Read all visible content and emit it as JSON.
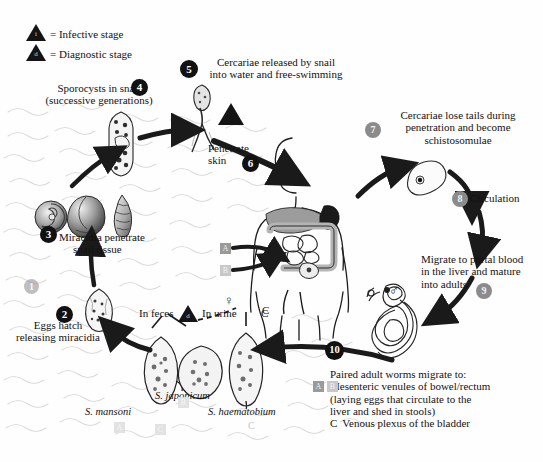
{
  "legend": {
    "infective": {
      "letter": "i",
      "label": "= Infective stage"
    },
    "diagnostic": {
      "letter": "d",
      "label": "= Diagnostic stage"
    }
  },
  "steps": [
    {
      "n": "1",
      "style": "gray-faint"
    },
    {
      "n": "2",
      "style": "black"
    },
    {
      "n": "3",
      "style": "black"
    },
    {
      "n": "4",
      "style": "black"
    },
    {
      "n": "5",
      "style": "black"
    },
    {
      "n": "6",
      "style": "black"
    },
    {
      "n": "7",
      "style": "gray"
    },
    {
      "n": "8",
      "style": "gray"
    },
    {
      "n": "9",
      "style": "gray"
    },
    {
      "n": "10",
      "style": "black"
    }
  ],
  "labels": {
    "sporocysts_line1": "Sporocysts in snail",
    "sporocysts_line2": "(successive generations)",
    "cercariae_released_line1": "Cercariae released by snail",
    "cercariae_released_line2": "into water and free-swimming",
    "penetrate_line1": "Penetrate",
    "penetrate_line2": "skin",
    "lose_tails_line1": "Cercariae lose tails during",
    "lose_tails_line2": "penetration and become",
    "lose_tails_line3": "schistosomulae",
    "circulation": "Circulation",
    "migrate_line1": "Migrate to portal blood",
    "migrate_line2": "in the liver and mature",
    "migrate_line3": "into adults",
    "miracidia_line1": "Miracidia penetrate",
    "miracidia_line2": "snail tissue",
    "eggs_hatch_line1": "Eggs hatch",
    "eggs_hatch_line2": "releasing miracidia",
    "in_feces": "In feces",
    "in_urine": "In urine",
    "species_mansoni": "S. mansoni",
    "species_japonicum": "S. japonicum",
    "species_haematobium": "S. haematobium"
  },
  "outcome": {
    "intro": "Paired adult worms migrate to:",
    "a_b_line1": "Mesenteric venules of bowel/rectum",
    "a_b_line2": "(laying eggs that circulate to the",
    "a_b_line3": "liver and shed in stools)",
    "c_letter": "C",
    "c_text": "Venous plexus of the bladder"
  },
  "markers": {
    "a": "A",
    "b": "B",
    "c": "C",
    "female_symbol": "♀",
    "male_symbol": "♂"
  },
  "colors": {
    "black_badge": "#111111",
    "gray_badge": "#8b8b8b",
    "water_line": "#d8d8d8",
    "arrow": "#1a1a1a",
    "marker_a": "#9a9a9a",
    "marker_b": "#c8c8c8"
  }
}
